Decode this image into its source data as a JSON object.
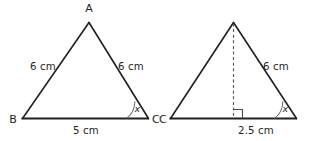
{
  "figure": {
    "background_color": "#ffffff",
    "line_color": "#231f20",
    "dashed_line_color": "#5a5a5a",
    "arc_color": "#6b6b6b"
  },
  "left_triangle": {
    "name": "triangle-ABC",
    "vertices": {
      "apex_label": "A",
      "bottom_left_label": "B",
      "bottom_right_label": "C"
    },
    "sides": {
      "left_side_label": "6 cm",
      "right_side_label": "6 cm",
      "base_label": "5 cm"
    },
    "angle": {
      "label": "x",
      "at_vertex": "C"
    }
  },
  "right_triangle": {
    "name": "triangle-right-with-altitude",
    "vertices": {
      "bottom_left_label": "C"
    },
    "sides": {
      "right_side_label": "6 cm",
      "half_base_label": "2.5 cm"
    },
    "angle": {
      "label": "x",
      "at_vertex": "bottom-right"
    },
    "altitude": {
      "style": "dashed",
      "right_angle_marker": true
    }
  }
}
